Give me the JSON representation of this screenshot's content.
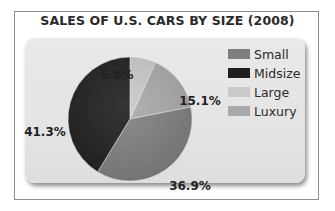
{
  "chart_data": {
    "type": "pie",
    "title": "SALES OF U.S. CARS BY SIZE (2008)",
    "unit": "%",
    "start_angle": "12 o'clock, clockwise",
    "slices": [
      {
        "name": "Large",
        "value": 6.8,
        "label": "6.8%",
        "color": "#c9c9c9"
      },
      {
        "name": "Luxury",
        "value": 15.1,
        "label": "15.1%",
        "color": "#a9a9a9"
      },
      {
        "name": "Small",
        "value": 36.9,
        "label": "36.9%",
        "color": "#7f7f7f"
      },
      {
        "name": "Midsize",
        "value": 41.3,
        "label": "41.3%",
        "color": "#1e1e1e"
      }
    ],
    "legend": {
      "placement": "right",
      "entries": [
        {
          "name": "Small",
          "color": "#7f7f7f"
        },
        {
          "name": "Midsize",
          "color": "#1e1e1e"
        },
        {
          "name": "Large",
          "color": "#c9c9c9"
        },
        {
          "name": "Luxury",
          "color": "#a9a9a9"
        }
      ]
    }
  }
}
